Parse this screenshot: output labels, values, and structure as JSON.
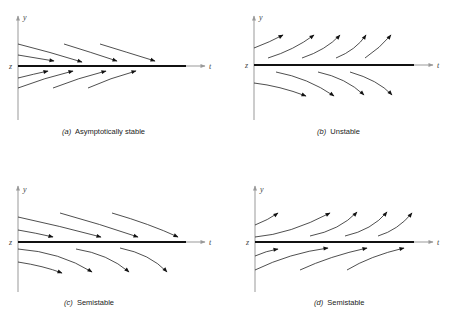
{
  "figure": {
    "type": "phase-line diagrams",
    "colors": {
      "background": "#ffffff",
      "equilibrium_line": "#111111",
      "trajectory": "#222222",
      "axis": "#888888"
    },
    "panels": [
      {
        "id": "a",
        "letter": "(a)",
        "caption": "Asymptotically stable",
        "axis_labels": {
          "y": "y",
          "t": "t",
          "z": "z"
        },
        "behavior_above": "converge down to z",
        "behavior_below": "converge up to z"
      },
      {
        "id": "b",
        "letter": "(b)",
        "caption": "Unstable",
        "axis_labels": {
          "y": "y",
          "t": "t",
          "z": "z"
        },
        "behavior_above": "diverge upward from z",
        "behavior_below": "diverge downward from z"
      },
      {
        "id": "c",
        "letter": "(c)",
        "caption": "Semistable",
        "axis_labels": {
          "y": "y",
          "t": "t",
          "z": "z"
        },
        "behavior_above": "converge down to z",
        "behavior_below": "diverge downward from z"
      },
      {
        "id": "d",
        "letter": "(d)",
        "caption": "Semistable",
        "axis_labels": {
          "y": "y",
          "t": "t",
          "z": "z"
        },
        "behavior_above": "diverge upward from z",
        "behavior_below": "converge up to z"
      }
    ]
  }
}
